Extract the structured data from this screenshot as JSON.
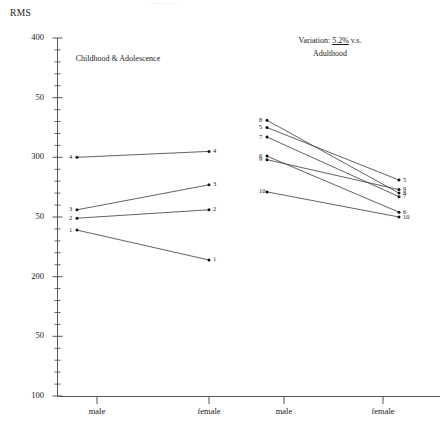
{
  "figure": {
    "ghost_header": "..........",
    "y_axis_title": "RMS"
  },
  "chart_data": {
    "type": "line",
    "title": "RMS",
    "xlabel": "",
    "ylabel": "RMS",
    "ylim": [
      100,
      400
    ],
    "yticks": [
      400,
      350,
      300,
      250,
      200,
      150,
      100
    ],
    "ytick_labels": [
      "400",
      "50",
      "300",
      "50",
      "200",
      "50",
      "100"
    ],
    "minor_tick_step": 10,
    "grid": false,
    "legend": "none",
    "panels": [
      {
        "name": "childhood",
        "title": "Childhood & Adolescence",
        "categories": [
          "male",
          "female"
        ],
        "series": [
          {
            "name": "4",
            "values": [
              300,
              305
            ]
          },
          {
            "name": "3",
            "values": [
              256,
              277
            ]
          },
          {
            "name": "2",
            "values": [
              249,
              256
            ]
          },
          {
            "name": "1",
            "values": [
              239,
              214
            ]
          }
        ]
      },
      {
        "name": "adulthood",
        "title_prefix": "Variation:",
        "title_value": "5.2%",
        "title_suffix": "v.s.",
        "title_second_line": "Adulthood",
        "categories": [
          "male",
          "female"
        ],
        "series": [
          {
            "name": "8",
            "values": [
              331,
              270
            ]
          },
          {
            "name": "5",
            "values": [
              325,
              281
            ]
          },
          {
            "name": "7",
            "values": [
              317,
              267
            ]
          },
          {
            "name": "6",
            "values": [
              301,
              254
            ]
          },
          {
            "name": "9",
            "values": [
              298,
              273
            ]
          },
          {
            "name": "10",
            "values": [
              271,
              250
            ]
          }
        ]
      }
    ],
    "x_tick_labels": [
      "male",
      "female",
      "male",
      "female"
    ],
    "colors": {
      "line": "#3a3a3a",
      "marker": "#111111",
      "axis": "#555555",
      "text": "#1a1a1a",
      "ghost": "#d8d8dc"
    }
  }
}
